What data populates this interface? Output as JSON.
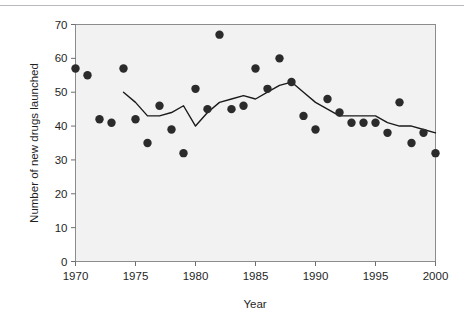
{
  "chart_data": {
    "type": "scatter",
    "title": "",
    "subtitle": "",
    "xlabel": "Year",
    "ylabel": "Number of new drugs launched",
    "xlim": [
      1970,
      2000
    ],
    "ylim": [
      0,
      70
    ],
    "xticks": [
      1970,
      1975,
      1980,
      1985,
      1990,
      1995,
      2000
    ],
    "xticklabels": [
      "1970",
      "1975",
      "1980",
      "1985",
      "1990",
      "1995",
      "2000"
    ],
    "yticks": [
      0,
      10,
      20,
      30,
      40,
      50,
      60,
      70
    ],
    "yticklabels": [
      "0",
      "10",
      "20",
      "30",
      "40",
      "50",
      "60",
      "70"
    ],
    "grid": false,
    "legend": "none",
    "plot_background": "#f2f2f2",
    "marker_color": "#2b2b2b",
    "line_color": "#1a1a1a",
    "axis_color": "#6e6e6e",
    "series": [
      {
        "name": "New drugs launched",
        "type": "scatter",
        "x": [
          1970,
          1971,
          1972,
          1973,
          1974,
          1975,
          1976,
          1977,
          1978,
          1979,
          1980,
          1981,
          1982,
          1983,
          1984,
          1985,
          1986,
          1987,
          1988,
          1989,
          1990,
          1991,
          1992,
          1993,
          1994,
          1995,
          1996,
          1997,
          1998,
          1999,
          2000
        ],
        "y": [
          57,
          55,
          42,
          41,
          57,
          42,
          35,
          46,
          39,
          32,
          51,
          45,
          67,
          45,
          46,
          57,
          51,
          60,
          53,
          43,
          39,
          48,
          44,
          41,
          41,
          41,
          38,
          47,
          35,
          38,
          32
        ]
      },
      {
        "name": "Five-year moving average",
        "type": "line",
        "x": [
          1974,
          1975,
          1976,
          1977,
          1978,
          1979,
          1980,
          1981,
          1982,
          1983,
          1984,
          1985,
          1986,
          1987,
          1988,
          1989,
          1990,
          1991,
          1992,
          1993,
          1994,
          1995,
          1996,
          1997,
          1998,
          1999,
          2000
        ],
        "y": [
          50,
          47,
          43,
          43,
          44,
          46,
          40,
          44,
          47,
          48,
          49,
          48,
          50,
          52,
          53,
          50,
          47,
          45,
          43,
          43,
          43,
          43,
          41,
          40,
          40,
          39,
          38
        ]
      }
    ]
  },
  "axes": {
    "x_axis_name": "year-axis",
    "y_axis_name": "drugs-axis"
  }
}
